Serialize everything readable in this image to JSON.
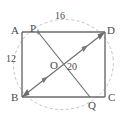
{
  "figure": {
    "type": "geometry-diagram",
    "shape": "rectangle-with-diagonals",
    "background_color": "#ffffff",
    "line_color": "#6b6b6b",
    "dashed_color": "#b0b0b0",
    "text_color": "#4a4a4a"
  },
  "vertices": {
    "A": "A",
    "B": "B",
    "C": "C",
    "D": "D",
    "P": "P",
    "Q": "Q",
    "O": "O"
  },
  "measures": {
    "top": "16",
    "left": "12",
    "center": "20"
  },
  "points": {
    "A": {
      "x": 22,
      "y": 32
    },
    "D": {
      "x": 105,
      "y": 32
    },
    "B": {
      "x": 22,
      "y": 97
    },
    "C": {
      "x": 105,
      "y": 97
    },
    "P": {
      "x": 38,
      "y": 32
    },
    "Q": {
      "x": 90,
      "y": 97
    },
    "O": {
      "x": 61,
      "y": 65
    }
  },
  "segments": [
    {
      "name": "side-AD",
      "from": "A",
      "to": "D",
      "style": "solid"
    },
    {
      "name": "side-DC",
      "from": "D",
      "to": "C",
      "style": "solid"
    },
    {
      "name": "side-CB",
      "from": "C",
      "to": "B",
      "style": "solid"
    },
    {
      "name": "side-BA",
      "from": "B",
      "to": "A",
      "style": "solid"
    },
    {
      "name": "diagonal-BD",
      "from": "B",
      "to": "D",
      "style": "solid-double-arrow"
    },
    {
      "name": "segment-PQ",
      "from": "P",
      "to": "Q",
      "style": "solid"
    },
    {
      "name": "arc-circumscribed",
      "style": "dashed-ellipse"
    }
  ]
}
